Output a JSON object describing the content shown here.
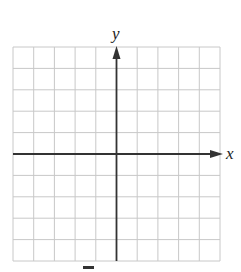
{
  "diagram": {
    "type": "coordinate-plane",
    "grid": {
      "columns": 10,
      "rows": 10,
      "color": "#c8c8c8",
      "left": 13,
      "top": 47,
      "right": 220,
      "bottom": 261
    },
    "axes": {
      "color": "#333333",
      "origin_column": 5,
      "origin_row": 5,
      "x_label": "x",
      "y_label": "y"
    }
  }
}
